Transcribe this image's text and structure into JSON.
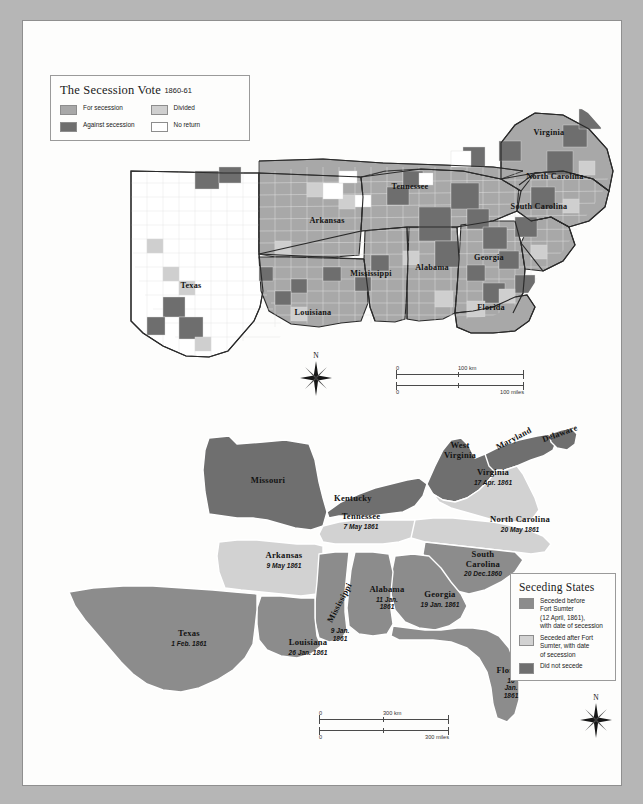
{
  "figure": {
    "background_color": "#b6b6b6",
    "sheet_color": "#fdfdfc"
  },
  "palette": {
    "for_secession": "#a8a8a8",
    "against_secession": "#6e6e6e",
    "divided": "#cfcfcf",
    "no_return": "#ffffff",
    "seceded_before_sumter": "#8c8c8c",
    "seceded_after_sumter": "#d2d2d2",
    "did_not_secede": "#6f6f6f",
    "water": "#fdfdfc",
    "county_line": "#e8e8e8",
    "state_line": "#2a2a2a",
    "text": "#131313"
  },
  "top_map": {
    "legend": {
      "title": "The Secession Vote",
      "title_years": "1860-61",
      "items": [
        {
          "label": "For secession",
          "swatch": "for_secession"
        },
        {
          "label": "Against secession",
          "swatch": "against_secession"
        },
        {
          "label": "Divided",
          "swatch": "divided"
        },
        {
          "label": "No return",
          "swatch": "no_return"
        }
      ]
    },
    "state_labels": [
      {
        "name": "Virginia",
        "x": 526,
        "y": 112
      },
      {
        "name": "North Carolina",
        "x": 532,
        "y": 156
      },
      {
        "name": "South Carolina",
        "x": 516,
        "y": 186
      },
      {
        "name": "Tennessee",
        "x": 387,
        "y": 166
      },
      {
        "name": "Arkansas",
        "x": 304,
        "y": 200
      },
      {
        "name": "Mississippi",
        "x": 348,
        "y": 253
      },
      {
        "name": "Alabama",
        "x": 409,
        "y": 247
      },
      {
        "name": "Georgia",
        "x": 466,
        "y": 237
      },
      {
        "name": "Florida",
        "x": 468,
        "y": 287
      },
      {
        "name": "Louisiana",
        "x": 290,
        "y": 292
      },
      {
        "name": "Texas",
        "x": 168,
        "y": 265
      }
    ],
    "scale": {
      "km": {
        "zero": "0",
        "value": "100 km"
      },
      "miles": {
        "zero": "0",
        "value": "100 miles"
      }
    },
    "compass": {
      "north": "N"
    }
  },
  "bottom_map": {
    "legend": {
      "title": "Seceding States",
      "items": [
        {
          "label": "Seceded before\nFort Sumter\n(12 April, 1861),\nwith date of secession",
          "swatch": "seceded_before_sumter"
        },
        {
          "label": "Seceded after Fort\nSumter, with date\nof secession",
          "swatch": "seceded_after_sumter"
        },
        {
          "label": "Did not secede",
          "swatch": "did_not_secede"
        }
      ]
    },
    "state_labels": [
      {
        "name": "Missouri",
        "date": "",
        "x": 245,
        "y": 460,
        "status": "did_not_secede"
      },
      {
        "name": "Kentucky",
        "date": "",
        "x": 330,
        "y": 478,
        "status": "did_not_secede"
      },
      {
        "name": "West\nVirginia",
        "date": "",
        "x": 437,
        "y": 430,
        "status": "did_not_secede"
      },
      {
        "name": "Maryland",
        "date": "",
        "x": 491,
        "y": 418,
        "status": "did_not_secede",
        "rotate": -28
      },
      {
        "name": "Delaware",
        "date": "",
        "x": 535,
        "y": 413,
        "status": "did_not_secede",
        "rotate": -20
      },
      {
        "name": "Virginia",
        "date": "17 Apr. 1861",
        "x": 470,
        "y": 456,
        "status": "seceded_after_sumter"
      },
      {
        "name": "North Carolina",
        "date": "20 May 1861",
        "x": 497,
        "y": 503,
        "status": "seceded_after_sumter"
      },
      {
        "name": "Tennessee",
        "date": "7 May 1861",
        "x": 338,
        "y": 500,
        "status": "seceded_after_sumter"
      },
      {
        "name": "Arkansas",
        "date": "9 May 1861",
        "x": 261,
        "y": 539,
        "status": "seceded_after_sumter"
      },
      {
        "name": "South\nCarolina",
        "date": "20 Dec.1860",
        "x": 460,
        "y": 543,
        "status": "seceded_before_sumter"
      },
      {
        "name": "Georgia",
        "date": "19 Jan. 1861",
        "x": 417,
        "y": 578,
        "status": "seceded_before_sumter"
      },
      {
        "name": "Alabama",
        "date": "11 Jan.\n1861",
        "x": 364,
        "y": 577,
        "status": "seceded_before_sumter"
      },
      {
        "name": "Mississippi",
        "date": "9 Jan.\n1861",
        "x": 317,
        "y": 582,
        "status": "seceded_before_sumter",
        "rotate": -62
      },
      {
        "name": "Louisiana",
        "date": "26 Jan. 1861",
        "x": 285,
        "y": 626,
        "status": "seceded_before_sumter"
      },
      {
        "name": "Texas",
        "date": "1 Feb. 1861",
        "x": 166,
        "y": 617,
        "status": "seceded_before_sumter"
      },
      {
        "name": "Florida",
        "date": "10\nJan.\n1861",
        "x": 488,
        "y": 662,
        "status": "seceded_before_sumter"
      }
    ],
    "scale": {
      "km": {
        "zero": "0",
        "value": "300 km"
      },
      "miles": {
        "zero": "0",
        "value": "300 miles"
      }
    },
    "compass": {
      "north": "N"
    }
  }
}
